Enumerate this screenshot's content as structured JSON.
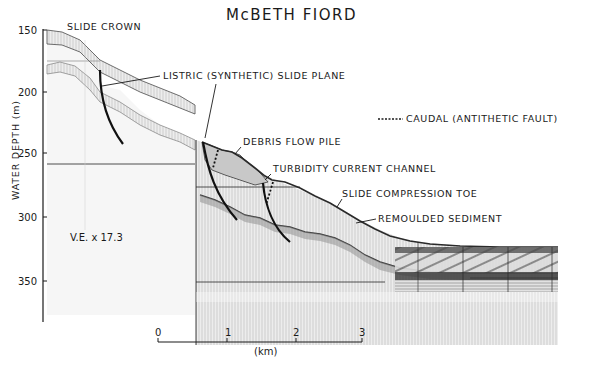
{
  "figure": {
    "title": "McBETH FIORD",
    "y_axis": {
      "label": "WATER DEPTH (m)",
      "ticks": [
        "150",
        "200",
        "250",
        "300",
        "350"
      ]
    },
    "vertical_exaggeration": "V.E. x 17.3",
    "scale_bar": {
      "ticks": [
        "0",
        "1",
        "2",
        "3"
      ],
      "unit": "(km)"
    },
    "annotations": {
      "slide_crown": "SLIDE CROWN",
      "listric_slide_plane": "LISTRIC (SYNTHETIC) SLIDE PLANE",
      "caudal_legend": "CAUDAL (ANTITHETIC FAULT)",
      "debris_flow_pile": "DEBRIS FLOW PILE",
      "turbidity_current_channel": "TURBIDITY CURRENT CHANNEL",
      "slide_compression_toe": "SLIDE COMPRESSION TOE",
      "remoulded_sediment": "REMOULDED SEDIMENT"
    },
    "colors": {
      "ink": "#1a1a1a",
      "seismic_dark": "#3a3a3a",
      "seismic_mid": "#8a8a8a",
      "seismic_light": "#d4d4d4",
      "background": "#ffffff"
    }
  }
}
